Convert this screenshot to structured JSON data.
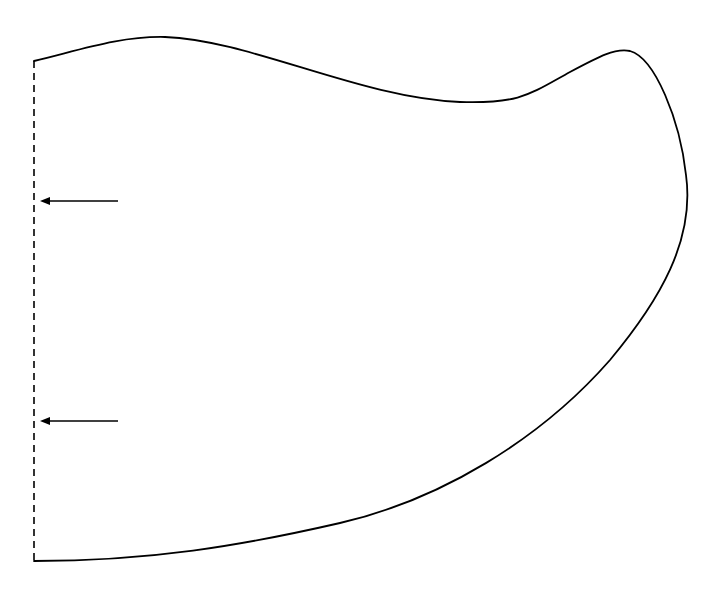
{
  "diagram": {
    "colors": {
      "background": "#ffffff",
      "stroke": "#000000"
    },
    "boundary": {
      "style": "dashed",
      "x": 34,
      "y_top": 61,
      "y_bottom": 561
    },
    "outline": {
      "style": "solid",
      "path": "M34,61 C80,50 120,36 165,37 C250,40 360,98 460,102 C520,104 530,94 570,72 C600,56 615,48 630,51 C655,58 680,120 686,175 C695,240 660,300 610,360 C540,440 440,500 340,523 C240,546 150,561 34,561"
    },
    "arrows": [
      {
        "name": "arrow-upper",
        "x1": 118,
        "x2": 40,
        "y": 201,
        "direction": "left"
      },
      {
        "name": "arrow-lower",
        "x1": 118,
        "x2": 40,
        "y": 421,
        "direction": "left"
      }
    ]
  }
}
